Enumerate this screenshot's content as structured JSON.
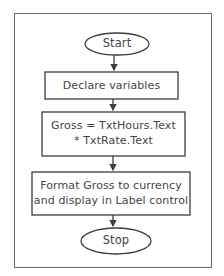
{
  "diagram": {
    "type": "flowchart",
    "nodes": [
      {
        "id": "start",
        "shape": "terminator",
        "label": "Start"
      },
      {
        "id": "declare",
        "shape": "process",
        "label": "Declare variables"
      },
      {
        "id": "gross",
        "shape": "process",
        "line1": "Gross = TxtHours.Text",
        "line2": "* TxtRate.Text"
      },
      {
        "id": "format",
        "shape": "process",
        "line1": "Format Gross to currency",
        "line2": "and display in Label control"
      },
      {
        "id": "stop",
        "shape": "terminator",
        "label": "Stop"
      }
    ],
    "edges": [
      {
        "from": "start",
        "to": "declare"
      },
      {
        "from": "declare",
        "to": "gross"
      },
      {
        "from": "gross",
        "to": "format"
      },
      {
        "from": "format",
        "to": "stop"
      }
    ],
    "colors": {
      "stroke": "#3c3c3c",
      "frame": "#6a6a6a",
      "background": "#ffffff"
    }
  }
}
